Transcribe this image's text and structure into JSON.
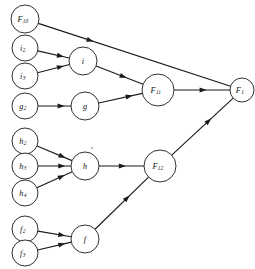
{
  "diagram": {
    "type": "node-link-diagram",
    "background_color": "#ffffff",
    "stroke_color": "#1a1a1a",
    "nodes": [
      {
        "id": "F10",
        "base": "F",
        "sub": "10",
        "cx": 25,
        "cy": 19,
        "r": 14
      },
      {
        "id": "i2",
        "base": "i",
        "sub": "2",
        "cx": 25,
        "cy": 48,
        "r": 13
      },
      {
        "id": "i",
        "base": "i",
        "sub": "",
        "cx": 83,
        "cy": 61,
        "r": 14
      },
      {
        "id": "i3",
        "base": "i",
        "sub": "3",
        "cx": 25,
        "cy": 76,
        "r": 13
      },
      {
        "id": "F11",
        "base": "F",
        "sub": "11",
        "cx": 158,
        "cy": 90,
        "r": 16
      },
      {
        "id": "F1",
        "base": "F",
        "sub": "1",
        "cx": 242,
        "cy": 90,
        "r": 12
      },
      {
        "id": "g2",
        "base": "g",
        "sub": "2",
        "cx": 25,
        "cy": 106,
        "r": 13
      },
      {
        "id": "g",
        "base": "g",
        "sub": "",
        "cx": 85,
        "cy": 106,
        "r": 14
      },
      {
        "id": "h2",
        "base": "h",
        "sub": "2",
        "cx": 25,
        "cy": 141,
        "r": 13
      },
      {
        "id": "h3",
        "base": "h",
        "sub": "3",
        "cx": 25,
        "cy": 166,
        "r": 13
      },
      {
        "id": "h",
        "base": "h",
        "sub": "",
        "cx": 85,
        "cy": 166,
        "r": 14
      },
      {
        "id": "h4",
        "base": "h",
        "sub": "4",
        "cx": 25,
        "cy": 193,
        "r": 13
      },
      {
        "id": "F12",
        "base": "F",
        "sub": "12",
        "cx": 160,
        "cy": 166,
        "r": 16
      },
      {
        "id": "f2",
        "base": "f",
        "sub": "2",
        "cx": 25,
        "cy": 229,
        "r": 13
      },
      {
        "id": "f",
        "base": "f",
        "sub": "",
        "cx": 85,
        "cy": 239,
        "r": 14
      },
      {
        "id": "f3",
        "base": "f",
        "sub": "3",
        "cx": 25,
        "cy": 253,
        "r": 13
      }
    ],
    "edges": [
      {
        "from": "F10",
        "to": "F1",
        "arrow_t": 0.27
      },
      {
        "from": "i2",
        "to": "i",
        "arrow_t": 0.72
      },
      {
        "from": "i3",
        "to": "i",
        "arrow_t": 0.72
      },
      {
        "from": "i",
        "to": "F11",
        "arrow_t": 0.58
      },
      {
        "from": "g2",
        "to": "g",
        "arrow_t": 0.7
      },
      {
        "from": "g",
        "to": "F11",
        "arrow_t": 0.7
      },
      {
        "from": "F11",
        "to": "F1",
        "arrow_t": 0.52
      },
      {
        "from": "h2",
        "to": "h",
        "arrow_t": 0.72
      },
      {
        "from": "h3",
        "to": "h",
        "arrow_t": 0.72
      },
      {
        "from": "h4",
        "to": "h",
        "arrow_t": 0.7
      },
      {
        "from": "h",
        "to": "F12",
        "arrow_t": 0.52
      },
      {
        "from": "f2",
        "to": "f",
        "arrow_t": 0.72
      },
      {
        "from": "f3",
        "to": "f",
        "arrow_t": 0.72
      },
      {
        "from": "f",
        "to": "F12",
        "arrow_t": 0.6
      },
      {
        "from": "F12",
        "to": "F1",
        "arrow_t": 0.6
      }
    ]
  }
}
